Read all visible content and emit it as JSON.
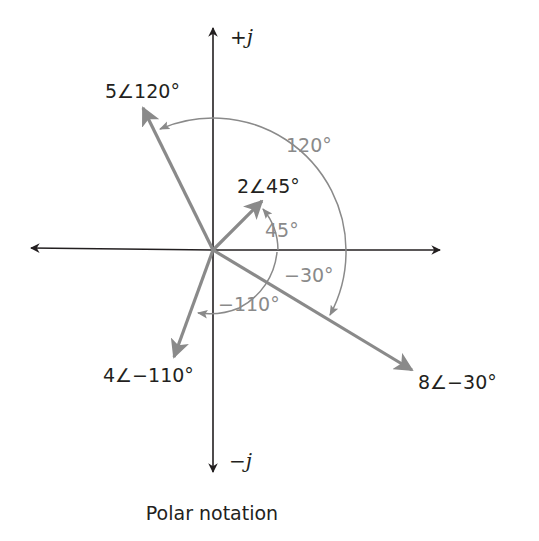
{
  "diagram": {
    "title": "Polar notation",
    "axes": {
      "positive_imag_label": "+j",
      "negative_imag_label": "−j",
      "positive_imag_sign": "+",
      "negative_imag_sign": "−",
      "imag_unit": "j"
    },
    "phasors": [
      {
        "label": "5∠120°",
        "magnitude": 5,
        "angle_deg": 120,
        "angle_label": "120°"
      },
      {
        "label": "2∠45°",
        "magnitude": 2,
        "angle_deg": 45,
        "angle_label": "45°"
      },
      {
        "label": "8∠−30°",
        "magnitude": 8,
        "angle_deg": -30,
        "angle_label": "−30°"
      },
      {
        "label": "4∠−110°",
        "magnitude": 4,
        "angle_deg": -110,
        "angle_label": "−110°"
      }
    ],
    "colors": {
      "axis": "#231f20",
      "phasor": "#8a8a8a",
      "angle_arc": "#8a8a8a",
      "text_dark": "#231f20",
      "text_gray": "#8a8a8a",
      "background": "#ffffff"
    }
  }
}
